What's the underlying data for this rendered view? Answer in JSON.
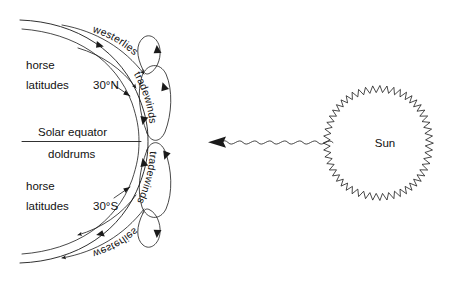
{
  "diagram": {
    "background_color": "#ffffff",
    "ink_color": "#1a1a1a"
  },
  "earth": {
    "equator_label_top": "Solar equator",
    "equator_label_bottom": "doldrums",
    "northern": {
      "horse_line1": "horse",
      "horse_line2": "latitudes",
      "latitude": "30°N",
      "westerlies": "westerlies",
      "tradewinds": "tradewinds"
    },
    "southern": {
      "horse_line1": "horse",
      "horse_line2": "latitudes",
      "latitude": "30°S",
      "westerlies": "westerlies",
      "tradewinds": "tradewinds"
    }
  },
  "sun": {
    "label": "Sun",
    "ray_arrow_direction": "left",
    "ray_style": "wavy"
  },
  "icons": {
    "sun_icon": "sun-jagged-disc",
    "ray_icon": "wavy-ray-arrow",
    "circulation_icon": "circulation-loop-arrow"
  }
}
